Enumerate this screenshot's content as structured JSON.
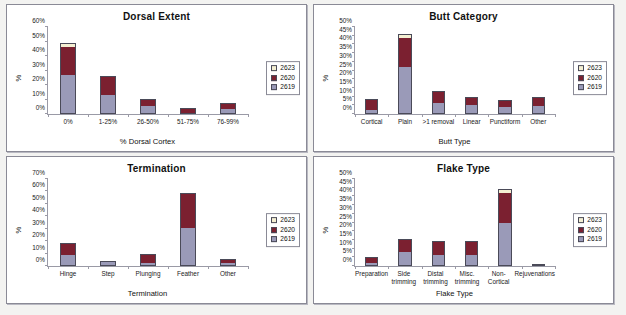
{
  "figure": {
    "background": "#f3f3f1",
    "panel_background": "#ffffff",
    "series_colors": {
      "2619": "#9a9ab8",
      "2620": "#7b2030",
      "2623": "#f4efd2"
    },
    "legend_labels": [
      "2623",
      "2620",
      "2619"
    ],
    "caption": ""
  },
  "chart_data": [
    {
      "type": "bar",
      "stacked": true,
      "title": "Dorsal Extent",
      "xlabel": "% Dorsal Cortex",
      "ylabel": "%",
      "ylim": [
        0,
        60
      ],
      "yticks": [
        "0%",
        "10%",
        "20%",
        "30%",
        "40%",
        "50%",
        "60%"
      ],
      "ytick_values": [
        0,
        10,
        20,
        30,
        40,
        50,
        60
      ],
      "grid": false,
      "legend_position": "right",
      "categories": [
        "0%",
        "1-25%",
        "26-50%",
        "51-75%",
        "76-99%"
      ],
      "series": [
        {
          "name": "2619",
          "values": [
            27.0,
            13.0,
            5.5,
            0.0,
            3.0
          ]
        },
        {
          "name": "2620",
          "values": [
            20.0,
            13.0,
            5.0,
            4.0,
            4.5
          ]
        },
        {
          "name": "2623",
          "values": [
            2.0,
            0.0,
            0.0,
            0.0,
            0.0
          ]
        }
      ],
      "totals": [
        49.0,
        26.0,
        10.5,
        4.0,
        7.5
      ]
    },
    {
      "type": "bar",
      "stacked": true,
      "title": "Butt Category",
      "xlabel": "Butt Type",
      "ylabel": "%",
      "ylim": [
        0,
        50
      ],
      "yticks": [
        "0%",
        "5%",
        "10%",
        "15%",
        "20%",
        "25%",
        "30%",
        "35%",
        "40%",
        "45%",
        "50%"
      ],
      "ytick_values": [
        0,
        5,
        10,
        15,
        20,
        25,
        30,
        35,
        40,
        45,
        50
      ],
      "grid": false,
      "legend_position": "right",
      "categories": [
        "Cortical",
        "Plain",
        ">1 removal",
        "Linear",
        "Punctiform",
        "Other"
      ],
      "series": [
        {
          "name": "2619",
          "values": [
            2.0,
            27.0,
            6.5,
            5.0,
            4.0,
            4.5
          ]
        },
        {
          "name": "2620",
          "values": [
            6.5,
            17.0,
            6.5,
            5.0,
            4.0,
            5.5
          ]
        },
        {
          "name": "2623",
          "values": [
            0.0,
            2.0,
            0.0,
            0.0,
            0.0,
            0.0
          ]
        }
      ],
      "totals": [
        8.5,
        46.0,
        13.0,
        10.0,
        8.0,
        10.0
      ]
    },
    {
      "type": "bar",
      "stacked": true,
      "title": "Termination",
      "xlabel": "Termination",
      "ylabel": "%",
      "ylim": [
        0,
        70
      ],
      "yticks": [
        "0%",
        "10%",
        "20%",
        "30%",
        "40%",
        "50%",
        "60%",
        "70%"
      ],
      "ytick_values": [
        0,
        10,
        20,
        30,
        40,
        50,
        60,
        70
      ],
      "grid": false,
      "legend_position": "right",
      "categories": [
        "Hinge",
        "Step",
        "Plunging",
        "Feather",
        "Other"
      ],
      "series": [
        {
          "name": "2619",
          "values": [
            9.0,
            4.0,
            2.0,
            31.0,
            2.0
          ]
        },
        {
          "name": "2620",
          "values": [
            9.5,
            0.0,
            7.5,
            28.0,
            3.5
          ]
        },
        {
          "name": "2623",
          "values": [
            0.0,
            0.0,
            0.0,
            0.0,
            0.0
          ]
        }
      ],
      "totals": [
        18.5,
        4.0,
        9.5,
        59.0,
        5.5
      ]
    },
    {
      "type": "bar",
      "stacked": true,
      "title": "Flake Type",
      "xlabel": "Flake Type",
      "ylabel": "%",
      "ylim": [
        0,
        50
      ],
      "yticks": [
        "0%",
        "5%",
        "10%",
        "15%",
        "20%",
        "25%",
        "30%",
        "35%",
        "40%",
        "45%",
        "50%"
      ],
      "ytick_values": [
        0,
        5,
        10,
        15,
        20,
        25,
        30,
        35,
        40,
        45,
        50
      ],
      "grid": false,
      "legend_position": "right",
      "categories": [
        "Preparation",
        "Side trimming",
        "Distal trimming",
        "Misc. trimming",
        "Non-Cortical",
        "Rejuvenations"
      ],
      "series": [
        {
          "name": "2619",
          "values": [
            1.5,
            8.0,
            6.5,
            6.5,
            24.5,
            0.0
          ]
        },
        {
          "name": "2620",
          "values": [
            3.5,
            7.5,
            8.0,
            8.0,
            18.0,
            1.0
          ]
        },
        {
          "name": "2623",
          "values": [
            0.0,
            0.0,
            0.0,
            0.0,
            2.0,
            0.0
          ]
        }
      ],
      "totals": [
        5.0,
        15.5,
        14.5,
        14.5,
        44.5,
        1.0
      ]
    }
  ]
}
